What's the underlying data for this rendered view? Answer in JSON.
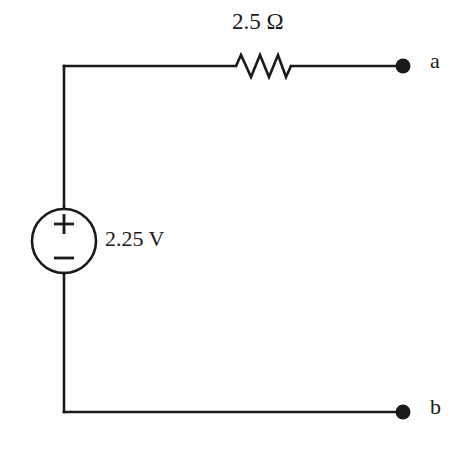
{
  "figure": {
    "background_color": "#ffffff",
    "line_color": "#1a1a1a",
    "width": 471,
    "height": 450
  },
  "components": {
    "resistor": {
      "name": "resistor",
      "label": "2.5 Ω",
      "value": "2.5",
      "unit": "Ω",
      "quantity": "resistance"
    },
    "voltage_source": {
      "name": "independent-voltage-source",
      "label": "2.25 V",
      "value": "2.25",
      "unit": "V",
      "quantity": "voltage",
      "polarity_top": "+",
      "polarity_bottom": "−"
    }
  },
  "terminals": [
    {
      "id": "a",
      "label": "a",
      "position": "top-right"
    },
    {
      "id": "b",
      "label": "b",
      "position": "bottom-right"
    }
  ]
}
